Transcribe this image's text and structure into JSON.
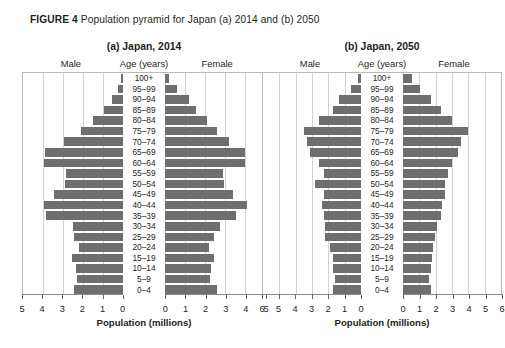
{
  "figure": {
    "label": "FIGURE 4",
    "caption": "Population pyramid for Japan (a) 2014 and (b) 2050"
  },
  "headings": {
    "male": "Male",
    "age": "Age (years)",
    "female": "Female",
    "axis_title": "Population (millions)"
  },
  "age_groups": [
    "100+",
    "95–99",
    "90–94",
    "85–89",
    "80–84",
    "75–79",
    "70–74",
    "65–69",
    "60–64",
    "55–59",
    "50–54",
    "45–49",
    "40–44",
    "35–39",
    "30–34",
    "25–29",
    "20–24",
    "15–19",
    "10–14",
    "5–9",
    "0–4"
  ],
  "chart_data": [
    {
      "type": "bar",
      "orientation": "horizontal",
      "subtype": "population-pyramid",
      "title": "(a) Japan, 2014",
      "xlabel": "Population (millions)",
      "ylabel": "Age (years)",
      "xlim": [
        0,
        5
      ],
      "xticks": [
        5,
        4,
        3,
        2,
        1,
        0,
        0,
        1,
        2,
        3,
        4,
        5
      ],
      "xtick_labels": [
        "5",
        "4",
        "3",
        "2",
        "1",
        "0",
        "0",
        "1",
        "2",
        "3",
        "4",
        "5"
      ],
      "grid": true,
      "legend": "none",
      "categories": [
        "100+",
        "95–99",
        "90–94",
        "85–89",
        "80–84",
        "75–79",
        "70–74",
        "65–69",
        "60–64",
        "55–59",
        "50–54",
        "45–49",
        "40–44",
        "35–39",
        "30–34",
        "25–29",
        "20–24",
        "15–19",
        "10–14",
        "5–9",
        "0–4"
      ],
      "series": [
        {
          "name": "Male",
          "side": "left",
          "values": [
            0.07,
            0.25,
            0.56,
            0.95,
            1.48,
            2.1,
            2.95,
            3.9,
            3.95,
            2.85,
            2.9,
            3.45,
            3.95,
            3.85,
            2.5,
            2.45,
            2.2,
            2.55,
            2.35,
            2.3,
            2.45
          ]
        },
        {
          "name": "Female",
          "side": "right",
          "values": [
            0.2,
            0.6,
            1.2,
            1.55,
            2.1,
            2.6,
            3.2,
            4.0,
            4.0,
            2.9,
            2.95,
            3.4,
            4.1,
            3.55,
            2.75,
            2.45,
            2.2,
            2.45,
            2.3,
            2.25,
            2.6
          ]
        }
      ]
    },
    {
      "type": "bar",
      "orientation": "horizontal",
      "subtype": "population-pyramid",
      "title": "(b) Japan, 2050",
      "xlabel": "Population (millions)",
      "ylabel": "Age (years)",
      "xlim": [
        0,
        6
      ],
      "xticks": [
        6,
        5,
        4,
        3,
        2,
        1,
        0,
        0,
        1,
        2,
        3,
        4,
        5,
        6
      ],
      "xtick_labels": [
        "6",
        "5",
        "4",
        "3",
        "2",
        "1",
        "0",
        "0",
        "1",
        "2",
        "3",
        "4",
        "5",
        "6"
      ],
      "grid": true,
      "legend": "none",
      "categories": [
        "100+",
        "95–99",
        "90–94",
        "85–89",
        "80–84",
        "75–79",
        "70–74",
        "65–69",
        "60–64",
        "55–59",
        "50–54",
        "45–49",
        "40–44",
        "35–39",
        "30–34",
        "25–29",
        "20–24",
        "15–19",
        "10–14",
        "5–9",
        "0–4"
      ],
      "series": [
        {
          "name": "Male",
          "side": "left",
          "values": [
            0.18,
            0.6,
            1.35,
            1.7,
            2.6,
            3.5,
            3.3,
            3.15,
            2.55,
            2.3,
            2.85,
            2.25,
            2.4,
            2.3,
            2.2,
            2.2,
            1.9,
            1.75,
            1.7,
            1.6,
            1.75
          ]
        },
        {
          "name": "Female",
          "side": "right",
          "values": [
            0.55,
            1.05,
            1.7,
            2.35,
            3.0,
            4.0,
            3.55,
            3.35,
            3.0,
            2.75,
            2.6,
            2.55,
            2.4,
            2.35,
            2.1,
            1.95,
            1.85,
            1.8,
            1.75,
            1.6,
            1.75
          ]
        }
      ]
    }
  ]
}
